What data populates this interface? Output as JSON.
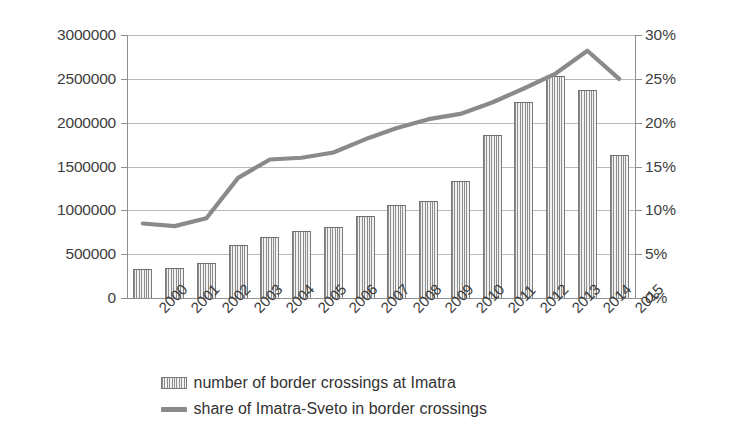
{
  "chart_data": {
    "type": "bar",
    "title": "",
    "subtitle": "",
    "xlabel": "",
    "ylabel": "",
    "grid": true,
    "legend_position": "bottom",
    "categories": [
      "2000",
      "2001",
      "2002",
      "2003",
      "2004",
      "2005",
      "2006",
      "2007",
      "2008",
      "2009",
      "2010",
      "2011",
      "2012",
      "2013",
      "2014",
      "2015"
    ],
    "axes": {
      "left": {
        "label": "",
        "ylim": [
          0,
          3000000
        ],
        "ticks": [
          0,
          500000,
          1000000,
          1500000,
          2000000,
          2500000,
          3000000
        ],
        "tick_labels": [
          "0",
          "500000",
          "1000000",
          "1500000",
          "2000000",
          "2500000",
          "3000000"
        ]
      },
      "right": {
        "label": "",
        "ylim": [
          0,
          30
        ],
        "ticks": [
          0,
          5,
          10,
          15,
          20,
          25,
          30
        ],
        "tick_labels": [
          "0%",
          "5%",
          "10%",
          "15%",
          "20%",
          "25%",
          "30%"
        ]
      }
    },
    "series": [
      {
        "name": "number of border crossings at Imatra",
        "type": "bar",
        "axis": "left",
        "color": "#8d8d8d",
        "values": [
          330000,
          345000,
          400000,
          610000,
          700000,
          765000,
          805000,
          930000,
          1065000,
          1110000,
          1340000,
          1855000,
          2240000,
          2530000,
          2370000,
          1630000
        ]
      },
      {
        "name": "share of Imatra-Sveto in border crossings",
        "type": "line",
        "axis": "right",
        "color": "#8a8a8a",
        "values": [
          8.5,
          8.2,
          9.1,
          13.7,
          15.8,
          16.0,
          16.6,
          18.1,
          19.4,
          20.4,
          21.0,
          22.3,
          23.9,
          25.6,
          28.2,
          25.0
        ]
      }
    ]
  },
  "legend": {
    "items": [
      {
        "label": "number of border crossings at Imatra",
        "marker": "bar-swatch"
      },
      {
        "label": "share of Imatra-Sveto in border crossings",
        "marker": "line-swatch"
      }
    ]
  }
}
